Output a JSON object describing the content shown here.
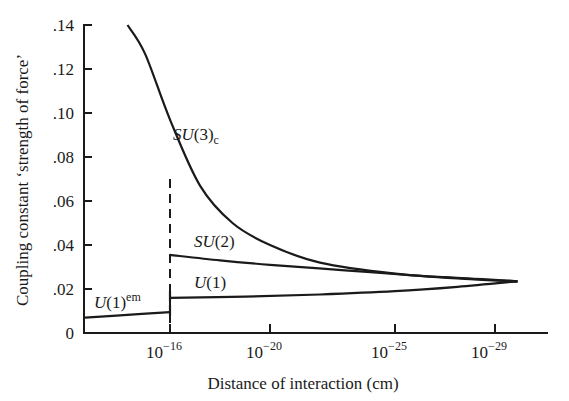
{
  "chart_data": {
    "type": "line",
    "title": "",
    "xlabel": "Distance of interaction (cm)",
    "ylabel": "Coupling constant ‘strength of force’",
    "x_scale": "log (decreasing distance to the right)",
    "x_ticks": [
      {
        "exp": -16,
        "label_base": "10",
        "label_exp": "−16"
      },
      {
        "exp": -20,
        "label_base": "10",
        "label_exp": "−20"
      },
      {
        "exp": -25,
        "label_base": "10",
        "label_exp": "−25"
      },
      {
        "exp": -29,
        "label_base": "10",
        "label_exp": "−29"
      }
    ],
    "y_ticks": [
      {
        "value": 0,
        "label": "0"
      },
      {
        "value": 0.02,
        "label": ".02"
      },
      {
        "value": 0.04,
        "label": ".04"
      },
      {
        "value": 0.06,
        "label": ".06"
      },
      {
        "value": 0.08,
        "label": ".08"
      },
      {
        "value": 0.1,
        "label": ".10"
      },
      {
        "value": 0.12,
        "label": ".12"
      },
      {
        "value": 0.14,
        "label": ".14"
      }
    ],
    "ylim": [
      0,
      0.14
    ],
    "xlim_exp": [
      -12.6,
      -30.2
    ],
    "grid": false,
    "legend": "inline labels",
    "divider": {
      "exp": -16,
      "style": "dashed",
      "y_top": 0.07
    },
    "series": [
      {
        "name": "SU(3)c",
        "label_main": "SU",
        "label_paren": "(3)",
        "label_sub": "c",
        "points": [
          [
            -14.3,
            0.14
          ],
          [
            -15.0,
            0.127
          ],
          [
            -16.0,
            0.097
          ],
          [
            -17.2,
            0.067
          ],
          [
            -18.5,
            0.05
          ],
          [
            -20.0,
            0.04
          ],
          [
            -22.0,
            0.032
          ],
          [
            -25.0,
            0.027
          ],
          [
            -28.0,
            0.0245
          ],
          [
            -29.9,
            0.0235
          ]
        ]
      },
      {
        "name": "SU(2)",
        "label_main": "SU",
        "label_paren": "(2)",
        "points": [
          [
            -16.0,
            0.0355
          ],
          [
            -18.0,
            0.033
          ],
          [
            -20.0,
            0.031
          ],
          [
            -23.0,
            0.0285
          ],
          [
            -26.0,
            0.026
          ],
          [
            -28.5,
            0.0245
          ],
          [
            -29.9,
            0.0235
          ]
        ]
      },
      {
        "name": "U(1)",
        "label_main": "U",
        "label_paren": "(1)",
        "points": [
          [
            -16.0,
            0.016
          ],
          [
            -19.0,
            0.0165
          ],
          [
            -22.0,
            0.0175
          ],
          [
            -25.0,
            0.019
          ],
          [
            -27.5,
            0.021
          ],
          [
            -29.9,
            0.0235
          ]
        ]
      },
      {
        "name": "U(1)em",
        "label_main": "U",
        "label_paren": "(1)",
        "label_sup": "em",
        "points": [
          [
            -12.6,
            0.007
          ],
          [
            -14.0,
            0.008
          ],
          [
            -16.0,
            0.0095
          ]
        ]
      }
    ]
  }
}
